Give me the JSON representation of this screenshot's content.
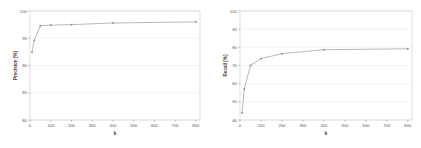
{
  "figure": {
    "background_color": "#ffffff",
    "line_color": "#9a9a9a",
    "grid_color": "#e9e9e9",
    "axis_color": "#8f8f8f",
    "text_color": "#555555"
  },
  "chart_data": [
    {
      "type": "line",
      "name": "precision-vs-k",
      "title": "",
      "xlabel": "k",
      "ylabel": "Precision [%]",
      "xlim": [
        0,
        820
      ],
      "ylim": [
        80,
        100
      ],
      "grid": true,
      "legend": null,
      "xticks": [
        0,
        100,
        200,
        300,
        400,
        500,
        600,
        700,
        800
      ],
      "xticklabels": [
        "0",
        "100",
        "200",
        "300",
        "400",
        "500",
        "600",
        "700",
        "800"
      ],
      "yticks": [
        80,
        85,
        90,
        95,
        100
      ],
      "yticklabels": [
        "80",
        "85",
        "90",
        "95",
        "100"
      ],
      "x": [
        10,
        20,
        50,
        100,
        200,
        400,
        800
      ],
      "values": [
        92.5,
        94.6,
        97.3,
        97.4,
        97.5,
        97.8,
        98.0
      ]
    },
    {
      "type": "line",
      "name": "recall-vs-k",
      "title": "",
      "xlabel": "k",
      "ylabel": "Recall [%]",
      "xlim": [
        0,
        820
      ],
      "ylim": [
        40,
        100
      ],
      "grid": true,
      "legend": null,
      "xticks": [
        0,
        100,
        200,
        300,
        400,
        500,
        600,
        700,
        800
      ],
      "xticklabels": [
        "0",
        "100",
        "200",
        "300",
        "400",
        "500",
        "600",
        "700",
        "800"
      ],
      "yticks": [
        40,
        50,
        60,
        70,
        80,
        90,
        100
      ],
      "yticklabels": [
        "40",
        "50",
        "60",
        "70",
        "80",
        "90",
        "100"
      ],
      "x": [
        10,
        20,
        50,
        100,
        200,
        400,
        800
      ],
      "values": [
        44.0,
        57.0,
        70.0,
        73.8,
        76.5,
        78.7,
        79.2
      ]
    }
  ]
}
